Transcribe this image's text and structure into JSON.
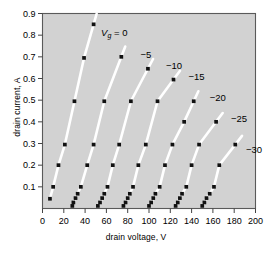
{
  "chart_data": {
    "type": "scatter",
    "title": "",
    "xlabel": "drain voltage, V",
    "ylabel": "drain current, A",
    "xlim": [
      0,
      200
    ],
    "ylim": [
      0,
      0.9
    ],
    "xticks": [
      0,
      20,
      40,
      60,
      80,
      100,
      120,
      140,
      160,
      180,
      200
    ],
    "xticklabels": [
      "0",
      "20",
      "40",
      "60",
      "80",
      "100",
      "120",
      "140",
      "160",
      "180",
      "200"
    ],
    "yticks": [
      0.1,
      0.2,
      0.3,
      0.4,
      0.5,
      0.6,
      0.7,
      0.8,
      0.9
    ],
    "yticklabels": [
      "0.1",
      "0.2",
      "0.3",
      "0.4",
      "0.5",
      "0.6",
      "0.7",
      "0.8",
      "0.9"
    ],
    "grid": false,
    "legend_position": "inline-curve-labels",
    "plot_background": "#d2d2d2",
    "line_color": "#ffffff",
    "marker_color": "#111111",
    "marker": "square",
    "series": [
      {
        "name": "Vg = 0",
        "label": "V",
        "label_sub": "g",
        "label_rest": " = 0",
        "label_x": 55,
        "label_y": 0.795,
        "points": [
          {
            "x": 7,
            "y": 0.045
          },
          {
            "x": 10,
            "y": 0.1
          },
          {
            "x": 15,
            "y": 0.2
          },
          {
            "x": 21,
            "y": 0.295
          },
          {
            "x": 30,
            "y": 0.495
          },
          {
            "x": 39,
            "y": 0.695
          },
          {
            "x": 48,
            "y": 0.85
          }
        ]
      },
      {
        "name": "-5",
        "label": "−5",
        "label_x": 92,
        "label_y": 0.695,
        "points": [
          {
            "x": 28,
            "y": 0.012
          },
          {
            "x": 29,
            "y": 0.028
          },
          {
            "x": 31,
            "y": 0.048
          },
          {
            "x": 33,
            "y": 0.068
          },
          {
            "x": 36,
            "y": 0.1
          },
          {
            "x": 42,
            "y": 0.2
          },
          {
            "x": 48,
            "y": 0.295
          },
          {
            "x": 58,
            "y": 0.495
          },
          {
            "x": 74,
            "y": 0.7
          }
        ]
      },
      {
        "name": "-10",
        "label": "−10",
        "label_x": 116,
        "label_y": 0.645,
        "points": [
          {
            "x": 52,
            "y": 0.012
          },
          {
            "x": 54,
            "y": 0.028
          },
          {
            "x": 56,
            "y": 0.048
          },
          {
            "x": 58,
            "y": 0.068
          },
          {
            "x": 61,
            "y": 0.1
          },
          {
            "x": 66,
            "y": 0.2
          },
          {
            "x": 72,
            "y": 0.295
          },
          {
            "x": 83,
            "y": 0.495
          },
          {
            "x": 99,
            "y": 0.645
          }
        ]
      },
      {
        "name": "-15",
        "label": "−15",
        "label_x": 137,
        "label_y": 0.595,
        "points": [
          {
            "x": 76,
            "y": 0.012
          },
          {
            "x": 78,
            "y": 0.028
          },
          {
            "x": 80,
            "y": 0.048
          },
          {
            "x": 82,
            "y": 0.068
          },
          {
            "x": 85,
            "y": 0.1
          },
          {
            "x": 90,
            "y": 0.2
          },
          {
            "x": 97,
            "y": 0.295
          },
          {
            "x": 108,
            "y": 0.495
          },
          {
            "x": 123,
            "y": 0.595
          }
        ]
      },
      {
        "name": "-20",
        "label": "−20",
        "label_x": 157,
        "label_y": 0.495,
        "points": [
          {
            "x": 100,
            "y": 0.012
          },
          {
            "x": 102,
            "y": 0.028
          },
          {
            "x": 104,
            "y": 0.048
          },
          {
            "x": 106,
            "y": 0.068
          },
          {
            "x": 110,
            "y": 0.1
          },
          {
            "x": 115,
            "y": 0.2
          },
          {
            "x": 122,
            "y": 0.295
          },
          {
            "x": 133,
            "y": 0.4
          },
          {
            "x": 142,
            "y": 0.495
          }
        ]
      },
      {
        "name": "-25",
        "label": "−25",
        "label_x": 177,
        "label_y": 0.4
      },
      {
        "name": "-30",
        "label": "−30",
        "label_x": 191,
        "label_y": 0.255
      }
    ],
    "series_extra": [
      {
        "name": "-25",
        "points": [
          {
            "x": 125,
            "y": 0.012
          },
          {
            "x": 127,
            "y": 0.028
          },
          {
            "x": 129,
            "y": 0.048
          },
          {
            "x": 131,
            "y": 0.068
          },
          {
            "x": 135,
            "y": 0.1
          },
          {
            "x": 140,
            "y": 0.2
          },
          {
            "x": 147,
            "y": 0.295
          },
          {
            "x": 163,
            "y": 0.4
          }
        ]
      },
      {
        "name": "-30",
        "points": [
          {
            "x": 150,
            "y": 0.012
          },
          {
            "x": 152,
            "y": 0.028
          },
          {
            "x": 154,
            "y": 0.048
          },
          {
            "x": 157,
            "y": 0.068
          },
          {
            "x": 161,
            "y": 0.1
          },
          {
            "x": 166,
            "y": 0.2
          },
          {
            "x": 181,
            "y": 0.295
          }
        ]
      }
    ]
  }
}
